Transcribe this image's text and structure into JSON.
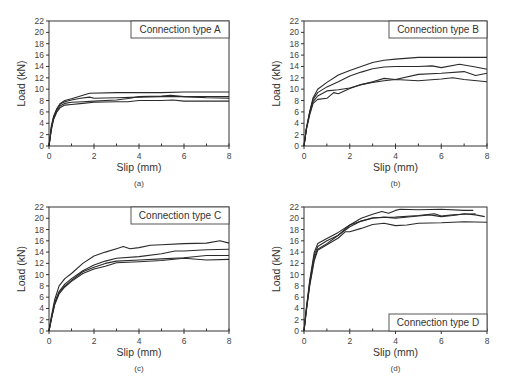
{
  "chart_data": [
    {
      "id": "a",
      "type": "line",
      "panel_label": "(a)",
      "title": "Connection type A",
      "title_position": "top-right",
      "xlabel": "Slip (mm)",
      "ylabel": "Load (kN)",
      "xlim": [
        0,
        8
      ],
      "ylim": [
        0,
        22
      ],
      "xticks": [
        0,
        2,
        4,
        6,
        8
      ],
      "yticks": [
        0,
        2,
        4,
        6,
        8,
        10,
        12,
        14,
        16,
        18,
        20,
        22
      ],
      "grid": false,
      "frame": {
        "x0": 49,
        "x1": 229,
        "y0": 146,
        "y1": 21
      },
      "series": [
        {
          "name": "specimen 1",
          "x": [
            0,
            0.1,
            0.2,
            0.35,
            0.5,
            0.7,
            1.0,
            1.4,
            1.8,
            3,
            4,
            5,
            6,
            7,
            8
          ],
          "y": [
            0,
            3.5,
            5.2,
            6.6,
            7.5,
            8.0,
            8.3,
            8.8,
            9.3,
            9.4,
            9.4,
            9.4,
            9.5,
            9.5,
            9.5
          ]
        },
        {
          "name": "specimen 2",
          "x": [
            0,
            0.1,
            0.2,
            0.35,
            0.5,
            0.7,
            1.0,
            1.4,
            1.8,
            2.0,
            3,
            4,
            5,
            6,
            7,
            8
          ],
          "y": [
            0,
            3.2,
            5.0,
            6.5,
            7.4,
            7.8,
            8.1,
            8.4,
            8.6,
            8.4,
            8.5,
            8.6,
            8.7,
            8.7,
            8.7,
            8.7
          ]
        },
        {
          "name": "specimen 3",
          "x": [
            0,
            0.1,
            0.2,
            0.35,
            0.5,
            0.7,
            1.0,
            1.5,
            2.0,
            3,
            3.6,
            4.0,
            5,
            5.4,
            6,
            7,
            8
          ],
          "y": [
            0,
            3.0,
            4.8,
            6.2,
            7.1,
            7.5,
            7.7,
            7.8,
            7.9,
            8.1,
            8.4,
            8.7,
            8.8,
            8.9,
            8.7,
            8.5,
            8.4
          ]
        },
        {
          "name": "specimen 4",
          "x": [
            0,
            0.1,
            0.2,
            0.35,
            0.5,
            0.7,
            1.0,
            1.5,
            2.0,
            3,
            3.5,
            4.0,
            5,
            5.5,
            6,
            7,
            8
          ],
          "y": [
            0,
            2.8,
            4.6,
            6.0,
            6.8,
            7.2,
            7.3,
            7.5,
            7.7,
            7.8,
            7.8,
            8.0,
            8.0,
            8.1,
            7.9,
            7.9,
            7.9
          ]
        }
      ]
    },
    {
      "id": "b",
      "type": "line",
      "panel_label": "(b)",
      "title": "Connection type B",
      "title_position": "top-right",
      "xlabel": "Slip (mm)",
      "ylabel": "Load (kN)",
      "xlim": [
        0,
        8
      ],
      "ylim": [
        0,
        22
      ],
      "xticks": [
        0,
        2,
        4,
        6,
        8
      ],
      "yticks": [
        0,
        2,
        4,
        6,
        8,
        10,
        12,
        14,
        16,
        18,
        20,
        22
      ],
      "grid": false,
      "frame": {
        "x0": 304,
        "x1": 487,
        "y0": 146,
        "y1": 21
      },
      "series": [
        {
          "name": "specimen 1",
          "x": [
            0,
            0.1,
            0.25,
            0.4,
            0.6,
            1.0,
            1.5,
            2.0,
            2.5,
            3.0,
            3.5,
            4.0,
            5.0,
            6.0,
            7.0,
            8.0
          ],
          "y": [
            0,
            3,
            6,
            8.5,
            10.0,
            11.2,
            12.5,
            13.3,
            14.0,
            14.7,
            15.1,
            15.3,
            15.6,
            15.6,
            15.6,
            15.6
          ]
        },
        {
          "name": "specimen 2",
          "x": [
            0,
            0.1,
            0.25,
            0.4,
            0.6,
            1.0,
            1.5,
            2.0,
            2.5,
            3.0,
            3.5,
            4.0,
            5.0,
            5.6,
            6.0,
            6.8,
            7.5,
            8.0
          ],
          "y": [
            0,
            3,
            6,
            8.2,
            9.4,
            10.4,
            11.3,
            12.3,
            13.0,
            13.6,
            13.9,
            14.0,
            14.0,
            14.1,
            13.8,
            14.4,
            13.9,
            13.5
          ]
        },
        {
          "name": "specimen 3",
          "x": [
            0,
            0.1,
            0.25,
            0.4,
            0.6,
            1.0,
            1.5,
            2.0,
            2.5,
            3.0,
            3.5,
            4.0,
            5.0,
            6.0,
            7.0,
            7.5,
            8.0
          ],
          "y": [
            0,
            3,
            5.8,
            7.8,
            8.8,
            9.7,
            9.9,
            10.2,
            10.8,
            11.3,
            11.9,
            11.7,
            12.6,
            12.8,
            13.1,
            12.4,
            12.8
          ]
        },
        {
          "name": "specimen 4",
          "x": [
            0,
            0.1,
            0.25,
            0.4,
            0.6,
            1.0,
            1.3,
            1.5,
            2.0,
            2.5,
            3.0,
            3.5,
            4.0,
            5.0,
            6.0,
            6.5,
            7.0,
            8.0
          ],
          "y": [
            0,
            2.8,
            5.5,
            7.5,
            8.2,
            8.4,
            9.4,
            9.2,
            10.1,
            10.8,
            11.2,
            11.5,
            11.7,
            11.5,
            11.8,
            12.0,
            11.7,
            11.3
          ]
        }
      ]
    },
    {
      "id": "c",
      "type": "line",
      "panel_label": "(c)",
      "title": "Connection type C",
      "title_position": "top-right",
      "xlabel": "Slip (mm)",
      "ylabel": "Load (kN)",
      "xlim": [
        0,
        8
      ],
      "ylim": [
        0,
        22
      ],
      "xticks": [
        0,
        2,
        4,
        6,
        8
      ],
      "yticks": [
        0,
        2,
        4,
        6,
        8,
        10,
        12,
        14,
        16,
        18,
        20,
        22
      ],
      "grid": false,
      "frame": {
        "x0": 49,
        "x1": 229,
        "y0": 331,
        "y1": 207
      },
      "series": [
        {
          "name": "specimen 1",
          "x": [
            0,
            0.1,
            0.25,
            0.45,
            0.7,
            1.0,
            1.5,
            2.0,
            2.5,
            3.0,
            3.3,
            3.6,
            4.0,
            4.5,
            5.0,
            6.0,
            7.0,
            7.6,
            8.0
          ],
          "y": [
            0,
            2.5,
            5.5,
            8.0,
            9.3,
            10.2,
            12.0,
            13.3,
            14.0,
            14.6,
            15.0,
            14.6,
            14.8,
            15.2,
            15.3,
            15.5,
            15.6,
            16.0,
            15.6
          ]
        },
        {
          "name": "specimen 2",
          "x": [
            0,
            0.1,
            0.25,
            0.45,
            0.7,
            1.0,
            1.5,
            2.0,
            2.5,
            3.0,
            4.0,
            5.0,
            5.6,
            6.0,
            7.0,
            8.0
          ],
          "y": [
            0,
            2.2,
            5.0,
            7.0,
            8.3,
            9.3,
            10.7,
            11.7,
            12.4,
            12.9,
            13.2,
            13.7,
            14.2,
            14.2,
            14.4,
            14.5
          ]
        },
        {
          "name": "specimen 3",
          "x": [
            0,
            0.1,
            0.25,
            0.45,
            0.7,
            1.0,
            1.5,
            2.0,
            2.5,
            3.0,
            4.0,
            5.0,
            6.0,
            7.0,
            8.0
          ],
          "y": [
            0,
            2.1,
            4.8,
            6.8,
            8.0,
            9.0,
            10.5,
            11.3,
            12.0,
            12.4,
            12.6,
            12.8,
            13.0,
            13.4,
            13.4
          ]
        },
        {
          "name": "specimen 4",
          "x": [
            0,
            0.1,
            0.25,
            0.45,
            0.7,
            1.0,
            1.5,
            2.0,
            2.5,
            3.0,
            4.0,
            5.0,
            6.0,
            7.0,
            8.0
          ],
          "y": [
            0,
            2.0,
            4.6,
            6.6,
            7.8,
            8.8,
            10.2,
            11.0,
            11.5,
            12.1,
            12.3,
            12.5,
            12.9,
            12.6,
            12.7
          ]
        }
      ]
    },
    {
      "id": "d",
      "type": "line",
      "panel_label": "(d)",
      "title": "Connection type D",
      "title_position": "bottom-right",
      "xlabel": "Slip (mm)",
      "ylabel": "Load (kN)",
      "xlim": [
        0,
        8
      ],
      "ylim": [
        0,
        22
      ],
      "xticks": [
        0,
        2,
        4,
        6,
        8
      ],
      "yticks": [
        0,
        2,
        4,
        6,
        8,
        10,
        12,
        14,
        16,
        18,
        20,
        22
      ],
      "grid": false,
      "frame": {
        "x0": 304,
        "x1": 487,
        "y0": 331,
        "y1": 207
      },
      "series": [
        {
          "name": "specimen 1",
          "x": [
            0,
            0.1,
            0.25,
            0.45,
            0.6,
            1.0,
            1.5,
            2.0,
            2.5,
            3.0,
            3.4,
            3.7,
            4.0,
            4.2,
            5.0,
            6.0,
            7.0,
            7.4
          ],
          "y": [
            0,
            4,
            9,
            14,
            15.5,
            16.4,
            17.5,
            18.8,
            20.0,
            20.7,
            21.2,
            20.9,
            21.4,
            21.6,
            21.5,
            21.6,
            21.4,
            21.4
          ]
        },
        {
          "name": "specimen 2",
          "x": [
            0,
            0.1,
            0.25,
            0.45,
            0.6,
            1.0,
            1.5,
            2.0,
            2.5,
            3.0,
            3.5,
            4.0,
            5.0,
            5.5,
            6.0,
            6.5,
            7.0,
            7.5,
            7.9
          ],
          "y": [
            0,
            3.8,
            8.6,
            13.5,
            15.0,
            16.0,
            17.0,
            18.5,
            19.5,
            20.0,
            20.2,
            20.0,
            20.4,
            20.6,
            20.3,
            20.5,
            20.8,
            20.6,
            20.3
          ]
        },
        {
          "name": "specimen 3",
          "x": [
            0,
            0.1,
            0.25,
            0.45,
            0.6,
            1.0,
            1.5,
            2.0,
            2.5,
            3.0,
            4.0,
            5.0,
            5.7,
            6.0,
            6.5,
            7.0,
            7.5
          ],
          "y": [
            0,
            3.6,
            8.3,
            13.0,
            14.5,
            15.5,
            17.0,
            18.8,
            19.5,
            20.1,
            20.2,
            20.5,
            20.8,
            20.4,
            20.6,
            20.7,
            20.8
          ]
        },
        {
          "name": "specimen 4",
          "x": [
            0,
            0.1,
            0.25,
            0.45,
            0.6,
            1.0,
            1.5,
            1.8,
            2.0,
            2.5,
            3.0,
            3.5,
            4.0,
            4.5,
            5.0,
            6.0,
            7.0,
            8.0
          ],
          "y": [
            0,
            3.5,
            8.0,
            12.5,
            14.3,
            15.3,
            16.5,
            17.6,
            17.6,
            18.2,
            18.9,
            19.1,
            18.7,
            18.8,
            19.1,
            19.2,
            19.4,
            19.3
          ]
        }
      ]
    }
  ]
}
